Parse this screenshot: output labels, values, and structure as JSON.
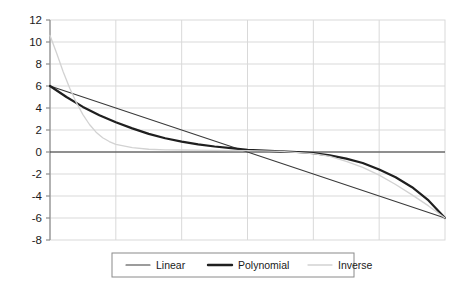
{
  "chart_data": {
    "type": "line",
    "title": "",
    "subtitle": "",
    "xlabel": "",
    "ylabel": "",
    "xlim": [
      0,
      6
    ],
    "ylim": [
      -8,
      12
    ],
    "ytick_labels": [
      "12",
      "10",
      "8",
      "6",
      "4",
      "2",
      "0",
      "-2",
      "-4",
      "-6",
      "-8"
    ],
    "ytick_values": [
      12,
      10,
      8,
      6,
      4,
      2,
      0,
      -2,
      -4,
      -6,
      -8
    ],
    "xtick_labels": [],
    "xtick_values": [
      0,
      1,
      2,
      3,
      4,
      5,
      6
    ],
    "grid": true,
    "grid_color": "#d9d9d9",
    "axis_color": "#8c8c8c",
    "zero_line_color": "#333333",
    "background": "#ffffff",
    "legend_position": "bottom",
    "legend_entries": [
      "Linear",
      "Polynomial",
      "Inverse"
    ],
    "series": [
      {
        "name": "Linear",
        "color": "#3a3a3a",
        "width": 1.1,
        "x": [
          0,
          1,
          2,
          3,
          4,
          5,
          6
        ],
        "values": [
          6,
          4,
          2,
          0,
          -2,
          -4,
          -6
        ]
      },
      {
        "name": "Polynomial",
        "color": "#1f1f1f",
        "width": 2.2,
        "x": [
          0,
          0.25,
          0.5,
          0.75,
          1,
          1.25,
          1.5,
          1.75,
          2,
          2.25,
          2.5,
          2.75,
          3,
          3.25,
          3.5,
          3.75,
          4,
          4.25,
          4.5,
          4.75,
          5,
          5.25,
          5.5,
          5.75,
          6
        ],
        "values": [
          6,
          5.0,
          4.1,
          3.35,
          2.7,
          2.15,
          1.65,
          1.25,
          0.95,
          0.7,
          0.5,
          0.35,
          0.2,
          0.12,
          0.05,
          0.0,
          -0.1,
          -0.3,
          -0.6,
          -1.0,
          -1.6,
          -2.3,
          -3.2,
          -4.4,
          -6
        ]
      },
      {
        "name": "Inverse",
        "color": "#d2d2d2",
        "width": 1.3,
        "x": [
          0,
          0.1,
          0.2,
          0.3,
          0.4,
          0.5,
          0.6,
          0.7,
          0.8,
          0.9,
          1,
          1.25,
          1.5,
          1.75,
          2,
          2.5,
          3,
          3.5,
          4,
          4.25,
          4.5,
          4.75,
          5,
          5.25,
          5.5,
          5.75,
          6
        ],
        "values": [
          10.6,
          9.0,
          7.3,
          5.8,
          4.5,
          3.4,
          2.5,
          1.8,
          1.3,
          0.95,
          0.7,
          0.4,
          0.25,
          0.2,
          0.18,
          0.15,
          0.12,
          0.05,
          -0.15,
          -0.4,
          -0.85,
          -1.4,
          -2.1,
          -2.95,
          -3.9,
          -4.9,
          -6
        ]
      }
    ]
  },
  "legend": {
    "items": [
      {
        "label": "Linear",
        "color": "#3a3a3a",
        "width": 1.1
      },
      {
        "label": "Polynomial",
        "color": "#1f1f1f",
        "width": 2.4
      },
      {
        "label": "Inverse",
        "color": "#d2d2d2",
        "width": 1.3
      }
    ]
  }
}
